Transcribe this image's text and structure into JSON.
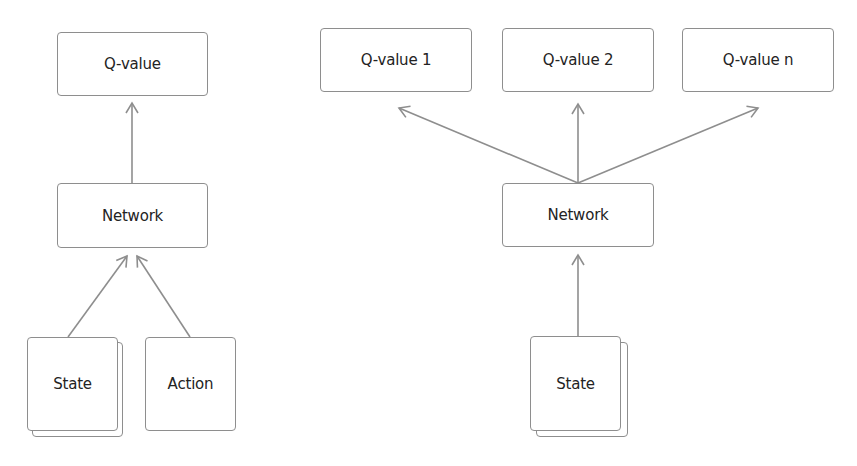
{
  "left_diagram": {
    "output": {
      "label": "Q-value"
    },
    "network": {
      "label": "Network"
    },
    "inputs": [
      {
        "label": "State",
        "stacked": true
      },
      {
        "label": "Action",
        "stacked": false
      }
    ]
  },
  "right_diagram": {
    "outputs": [
      {
        "label": "Q-value 1"
      },
      {
        "label": "Q-value 2"
      },
      {
        "label": "Q-value n"
      }
    ],
    "network": {
      "label": "Network"
    },
    "input": {
      "label": "State",
      "stacked": true
    }
  },
  "colors": {
    "stroke": "#8e8e8e",
    "text": "#232323",
    "background": "#ffffff"
  }
}
